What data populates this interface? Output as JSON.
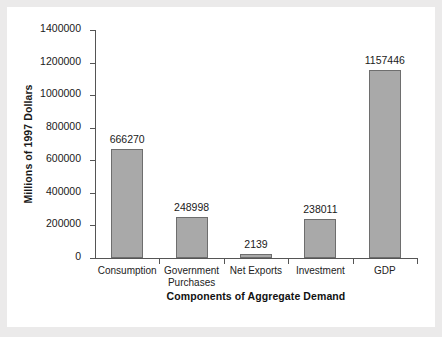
{
  "chart_data": {
    "type": "bar",
    "title": "",
    "xlabel": "Components of Aggregate Demand",
    "ylabel": "Millions of 1997 Dollars",
    "categories": [
      "Consumption",
      "Government Purchases",
      "Net Exports",
      "Investment",
      "GDP"
    ],
    "category_lines": [
      [
        "Consumption"
      ],
      [
        "Government",
        "Purchases"
      ],
      [
        "Net Exports"
      ],
      [
        "Investment"
      ],
      [
        "GDP"
      ]
    ],
    "values": [
      666270,
      248998,
      2139,
      238011,
      1157446
    ],
    "value_labels": [
      "666270",
      "248998",
      "2139",
      "238011",
      "1157446"
    ],
    "ylim": [
      0,
      1400000
    ],
    "ytick_values": [
      0,
      200000,
      400000,
      600000,
      800000,
      1000000,
      1200000,
      1400000
    ],
    "ytick_labels": [
      "0",
      "200000",
      "400000",
      "600000",
      "800000",
      "1000000",
      "1200000",
      "1400000"
    ],
    "grid": false,
    "legend": false,
    "bar_color": "#a9a9a9",
    "bar_edge_color": "#6e6e6e",
    "axis_color": "#555555",
    "text_color": "#1a1a1a",
    "background_color": "#ffffff",
    "page_background_color": "#ebeaea"
  }
}
